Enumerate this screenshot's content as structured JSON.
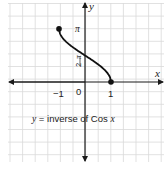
{
  "chart_data": {
    "type": "line",
    "title": "",
    "caption": "y = inverse of Cos x",
    "caption_parts": {
      "var": "y",
      "mid": " = inverse of Cos ",
      "arg": "x"
    },
    "xlabel": "x",
    "ylabel": "y",
    "x_ticks": [
      {
        "value": -1,
        "label": "−1"
      },
      {
        "value": 0,
        "label": "0"
      },
      {
        "value": 1,
        "label": "1"
      }
    ],
    "y_ticks": [
      {
        "value": 1.5708,
        "label_num": "π",
        "label_den": "2"
      },
      {
        "value": 3.1416,
        "label": "π"
      }
    ],
    "xlim": [
      -3.0,
      3.0
    ],
    "ylim": [
      -4.6,
      4.6
    ],
    "grid": true,
    "series": [
      {
        "name": "arccos",
        "x": [
          -1,
          -0.9,
          -0.75,
          -0.5,
          -0.25,
          0,
          0.25,
          0.5,
          0.75,
          0.9,
          1
        ],
        "y": [
          3.1416,
          2.6906,
          2.4189,
          2.0944,
          1.8235,
          1.5708,
          1.3181,
          1.0472,
          0.7227,
          0.451,
          0
        ],
        "endpoints": [
          {
            "x": -1,
            "y": 3.1416,
            "closed": true
          },
          {
            "x": 1,
            "y": 0,
            "closed": true
          }
        ]
      }
    ]
  },
  "colors": {
    "grid": "#d9d9d9",
    "axis": "#1a1a1a",
    "curve": "#111111",
    "text": "#222222"
  }
}
